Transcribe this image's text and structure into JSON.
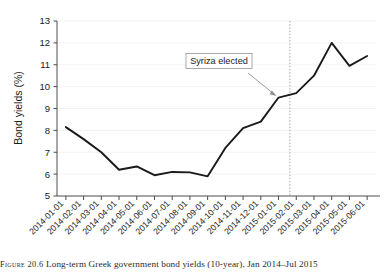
{
  "figure": {
    "caption_label": "Figure 20.6",
    "caption_text": "Long-term Greek government bond yields (10-year), Jan 2014–Jul 2015"
  },
  "chart_data": {
    "type": "line",
    "title": "",
    "xlabel": "",
    "ylabel": "Bond yields (%)",
    "ylim": [
      5,
      13
    ],
    "yticks": [
      "5",
      "6",
      "7",
      "8",
      "9",
      "10",
      "11",
      "12",
      "13"
    ],
    "grid": "horizontal-faint",
    "legend": "none",
    "line_color": "#1a1a1a",
    "categories": [
      "2014-01-01",
      "2014-02-01",
      "2014-03-01",
      "2014-04-01",
      "2014-05-01",
      "2014-06-01",
      "2014-07-01",
      "2014-08-01",
      "2014-09-01",
      "2014-10-01",
      "2014-11-01",
      "2014-12-01",
      "2015-01-01",
      "2015-02-01",
      "2015-03-01",
      "2015-04-01",
      "2015-05-01",
      "2015-06-01"
    ],
    "values": [
      8.15,
      7.6,
      7.0,
      6.2,
      6.35,
      5.95,
      6.1,
      6.08,
      5.9,
      7.2,
      8.1,
      8.4,
      9.5,
      9.7,
      10.5,
      12.0,
      10.95,
      11.4
    ],
    "annotations": [
      {
        "text": "Syriza elected",
        "marker_type": "vertical-dotted-line",
        "marker_x": "2015-01-20",
        "marker_value": 9.6,
        "marker_color": "#8c8c8c"
      }
    ]
  }
}
